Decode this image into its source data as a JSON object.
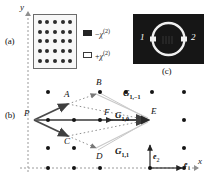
{
  "figure": {
    "axes": {
      "y_label": "y",
      "x_label": "x"
    },
    "panels": [
      {
        "tag": "(a)",
        "name": "lattice-structure"
      },
      {
        "tag": "(b)",
        "name": "reciprocal-space-diagram"
      },
      {
        "tag": "(c)",
        "name": "ring-resonator-image"
      }
    ]
  },
  "panel_a": {
    "tag": "(a)",
    "rows": 5,
    "cols": 5,
    "dot_count": 25
  },
  "legend": {
    "items": [
      {
        "swatch": "filled-square",
        "sign": "−",
        "symbol": "χ",
        "exponent": "(2)",
        "label": "−χ(2)"
      },
      {
        "swatch": "open-square",
        "sign": "+",
        "symbol": "χ",
        "exponent": "(2)",
        "label": "+χ(2)"
      }
    ]
  },
  "panel_c": {
    "tag": "(c)",
    "port_left": "1",
    "port_right": "2",
    "ring_color": "#f2f2f2",
    "background_color": "#161616"
  },
  "panel_b": {
    "tag": "(b)",
    "source_point": "P",
    "points": [
      {
        "id": "A",
        "label": "A"
      },
      {
        "id": "B",
        "label": "B"
      },
      {
        "id": "C",
        "label": "C"
      },
      {
        "id": "D",
        "label": "D"
      },
      {
        "id": "E",
        "label": "E"
      },
      {
        "id": "F",
        "label": "F"
      }
    ],
    "reciprocal_vectors": [
      {
        "id": "G1m1",
        "symbol": "G",
        "subscript": "1,−1"
      },
      {
        "id": "G10",
        "symbol": "G",
        "subscript": "1,0"
      },
      {
        "id": "G11",
        "symbol": "G",
        "subscript": "1,1"
      }
    ],
    "basis_vectors": [
      {
        "id": "e1",
        "symbol": "e",
        "subscript": "1"
      },
      {
        "id": "e2",
        "symbol": "e",
        "subscript": "2"
      }
    ],
    "lattice_rows": 5,
    "lattice_cols": 6
  },
  "colors": {
    "dot": "#151515",
    "arrow": "#4a4a4a",
    "dotted": "#8a8a8a",
    "panel_c_bg": "#161616",
    "ring": "#f2f2f2",
    "axis": "#9a9a9a"
  }
}
